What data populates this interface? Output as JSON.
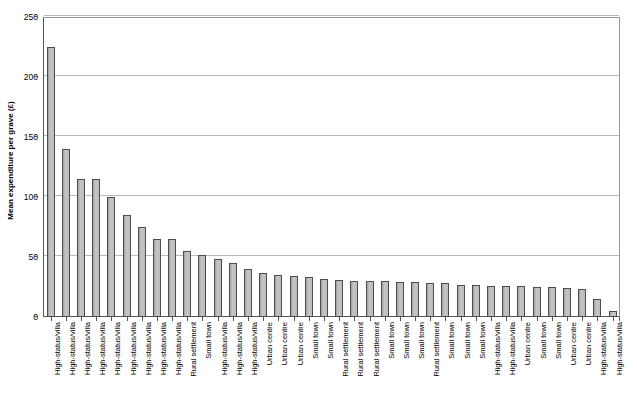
{
  "chart_data": {
    "type": "bar",
    "title": "",
    "xlabel": "",
    "ylabel": "Mean expenditure per grave (£)",
    "ylim": [
      0,
      250
    ],
    "yticks": [
      0,
      50,
      100,
      150,
      200,
      250
    ],
    "ytick_labels": [
      "0",
      "50",
      "100",
      "150",
      "200",
      "250"
    ],
    "grid": true,
    "legend": false,
    "bar_color": "#b3b3b3",
    "bar_edge_color": "#4d4d4d",
    "gridline_color": "#b9b9b9",
    "axis_color": "#555555",
    "categories": [
      "High-status/villa",
      "High-status/villa",
      "High-status/villa",
      "High-status/villa",
      "High-status/villa",
      "High-status/villa",
      "High-status/villa",
      "High-status/villa",
      "High-status/villa",
      "Rural settlement",
      "Small town",
      "High-status/villa",
      "High-status/villa",
      "High-status/villa",
      "Urban centre",
      "Urban centre",
      "Urban centre",
      "Small town",
      "Small town",
      "Rural settlement",
      "Rural settlement",
      "Rural settlement",
      "Small town",
      "Small town",
      "Small town",
      "Rural settlement",
      "Small town",
      "Small town",
      "Small town",
      "High-status/villa",
      "High-status/villa",
      "Urban centre",
      "Small town",
      "Small town",
      "Urban centre",
      "Urban centre",
      "High-status/villa",
      "High-status/villa"
    ],
    "values": [
      225,
      140,
      115,
      115,
      100,
      85,
      75,
      65,
      65,
      55,
      52,
      48,
      45,
      40,
      37,
      35,
      34,
      33,
      32,
      31,
      30,
      30,
      30,
      29,
      29,
      28,
      28,
      27,
      27,
      26,
      26,
      26,
      25,
      25,
      24,
      23,
      15,
      5
    ]
  }
}
